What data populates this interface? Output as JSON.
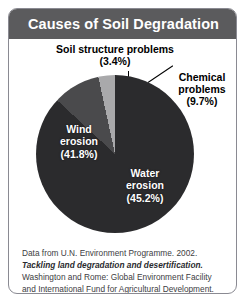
{
  "figure": {
    "title": "Causes of Soil Degradation",
    "title_color": "#5b5b5d",
    "frame_color": "#8a8a92"
  },
  "callouts": {
    "soil_structure": {
      "name": "Soil structure problems",
      "value_label": "(3.4%)",
      "line1": "Soil structure problems",
      "line2": "(3.4%)"
    },
    "chemical": {
      "name": "Chemical problems",
      "line1": "Chemical",
      "line2": "problems",
      "line3": "(9.7%)"
    }
  },
  "slice_labels": {
    "wind": {
      "line1": "Wind",
      "line2": "erosion",
      "line3": "(41.8%)"
    },
    "water": {
      "line1": "Water",
      "line2": "erosion",
      "line3": "(45.2%)"
    }
  },
  "caption": {
    "part1": "Data from U.N. Environment Programme. 2002. ",
    "italic": "Tackling land degradation and desertification.",
    "part2": " Washington and Rome: Global Environment Facility and International Fund for Agricultural Development."
  },
  "chart_data": {
    "type": "pie",
    "title": "Causes of Soil Degradation",
    "categories": [
      "Water erosion",
      "Wind erosion",
      "Chemical problems",
      "Soil structure problems"
    ],
    "values": [
      45.2,
      41.8,
      9.7,
      3.4
    ],
    "unit": "%",
    "colors": [
      "#2b2b2d",
      "#2b2b2d",
      "#4a4a4c",
      "#a9a9ab"
    ],
    "legend": "none",
    "labels_inside": [
      "Water erosion (45.2%)",
      "Wind erosion (41.8%)"
    ],
    "labels_outside": [
      "Chemical problems (9.7%)",
      "Soil structure problems (3.4%)"
    ],
    "start_angle_deg": 0,
    "direction": "clockwise",
    "gridlines": false
  }
}
